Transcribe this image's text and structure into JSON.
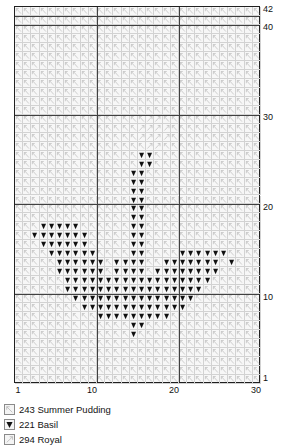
{
  "chart_data": {
    "type": "heatmap",
    "title": "",
    "xlabel": "",
    "ylabel": "",
    "cols": 30,
    "rows": 42,
    "grid": true,
    "heavy_grid_every": 10,
    "xlim": [
      1,
      30
    ],
    "ylim": [
      1,
      42
    ],
    "x_ticks": [
      "1",
      "10",
      "20",
      "30"
    ],
    "x_tick_values": [
      1,
      10,
      20,
      30
    ],
    "y_ticks": [
      "1",
      "10",
      "20",
      "30",
      "40",
      "42"
    ],
    "y_tick_values": [
      1,
      10,
      20,
      30,
      40,
      42
    ],
    "background_symbol": "backslash",
    "series": [
      {
        "name": "243 Summer Pudding",
        "symbol": "backslash",
        "value": 243,
        "coverage": "all cells not otherwise marked"
      },
      {
        "name": "221 Basil",
        "symbol": "filled-triangle-down",
        "value": 221,
        "cells_by_row": {
          "26": [
            16,
            17
          ],
          "25": [
            16,
            17
          ],
          "24": [
            15,
            16
          ],
          "23": [
            15,
            16
          ],
          "22": [
            15,
            16
          ],
          "21": [
            15,
            16
          ],
          "20": [
            15,
            16
          ],
          "19": [
            15,
            16
          ],
          "18": [
            4,
            5,
            6,
            7,
            8,
            15,
            16
          ],
          "17": [
            3,
            4,
            5,
            6,
            7,
            8,
            9,
            15,
            16
          ],
          "16": [
            4,
            5,
            6,
            7,
            8,
            9,
            15,
            16
          ],
          "15": [
            5,
            6,
            7,
            8,
            9,
            10,
            15,
            16,
            21,
            22,
            23,
            24,
            25,
            26
          ],
          "14": [
            6,
            7,
            8,
            9,
            10,
            11,
            13,
            14,
            15,
            16,
            19,
            20,
            21,
            22,
            23,
            24,
            25,
            27
          ],
          "13": [
            6,
            7,
            8,
            9,
            10,
            11,
            13,
            14,
            15,
            16,
            18,
            19,
            20,
            21,
            22,
            23,
            24,
            25
          ],
          "12": [
            7,
            8,
            9,
            10,
            11,
            12,
            13,
            14,
            15,
            16,
            17,
            18,
            19,
            20,
            21,
            22,
            23,
            24
          ],
          "11": [
            7,
            8,
            9,
            10,
            11,
            12,
            13,
            14,
            15,
            16,
            17,
            18,
            19,
            20,
            21,
            22,
            23
          ],
          "10": [
            8,
            9,
            10,
            11,
            12,
            13,
            14,
            15,
            16,
            17,
            18,
            19,
            20,
            21,
            22
          ],
          "9": [
            9,
            10,
            11,
            12,
            13,
            14,
            15,
            16,
            17,
            18,
            19,
            20,
            21
          ],
          "8": [
            11,
            12,
            13,
            14,
            15,
            16,
            17,
            18,
            19
          ],
          "7": [
            15,
            16
          ],
          "6": [
            15
          ]
        }
      },
      {
        "name": "294 Royal",
        "symbol": "forward-slash",
        "value": 294,
        "cells_by_row": {
          "30": [
            17,
            18
          ],
          "29": [
            16,
            17,
            18,
            19
          ],
          "28": [
            16,
            17,
            18,
            19
          ],
          "27": [
            17,
            18
          ]
        }
      }
    ]
  },
  "axes": {
    "y_labels": [
      {
        "text": "42",
        "row": 42
      },
      {
        "text": "40",
        "row": 40
      },
      {
        "text": "30",
        "row": 30
      },
      {
        "text": "20",
        "row": 20
      },
      {
        "text": "10",
        "row": 10
      },
      {
        "text": "1",
        "row": 1
      }
    ],
    "x_labels": [
      {
        "text": "1",
        "col": 1
      },
      {
        "text": "10",
        "col": 10
      },
      {
        "text": "20",
        "col": 20
      },
      {
        "text": "30",
        "col": 30
      }
    ]
  },
  "legend": {
    "items": [
      {
        "code": "243",
        "name": "Summer Pudding",
        "label": "243 Summer Pudding",
        "symbol": "backslash"
      },
      {
        "code": "221",
        "name": "Basil",
        "label": "221 Basil",
        "symbol": "filled-triangle-down"
      },
      {
        "code": "294",
        "name": "Royal",
        "label": "294 Royal",
        "symbol": "forward-slash"
      }
    ]
  },
  "colors": {
    "grid_line": "#d2d2d2",
    "heavy_line": "#404040",
    "frame": "#202020",
    "cell_background": "#f7f7f7",
    "symbol_light": "#b9b9b9",
    "symbol_dark": "#111111",
    "text": "#141414"
  }
}
